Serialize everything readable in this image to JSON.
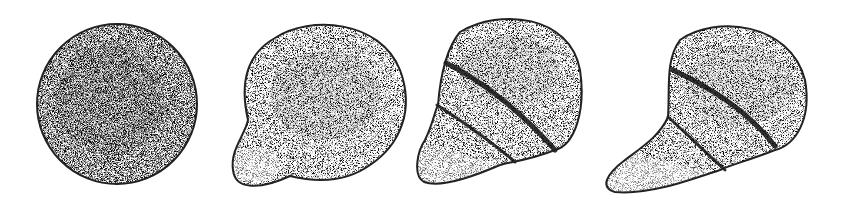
{
  "figure": {
    "colors": {
      "outline": "#222222",
      "stipple_dark": "#1a1a1a",
      "background": "#ffffff"
    },
    "cells": [
      {
        "id": "stage-1",
        "shape": "round",
        "bands": 0
      },
      {
        "id": "stage-2",
        "shape": "round-with-bulge",
        "bands": 0
      },
      {
        "id": "stage-3",
        "shape": "pear",
        "bands": 2
      },
      {
        "id": "stage-4",
        "shape": "elongated-pear",
        "bands": 2
      }
    ]
  }
}
